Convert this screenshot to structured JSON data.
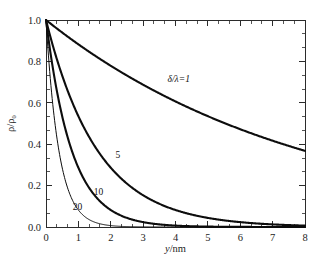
{
  "chart_data": {
    "type": "line",
    "title": "",
    "xlabel": "y/nm",
    "ylabel": "ρ/ρ₀",
    "xlim": [
      0,
      8
    ],
    "ylim": [
      0.0,
      1.0
    ],
    "grid": false,
    "legend_position": "inline-annotations",
    "x_ticks": [
      "0",
      "1",
      "2",
      "3",
      "4",
      "5",
      "6",
      "7",
      "8"
    ],
    "x_tick_values": [
      0,
      1,
      2,
      3,
      4,
      5,
      6,
      7,
      8
    ],
    "x_minor_per_interval": 2,
    "y_ticks": [
      "0.0",
      "0.2",
      "0.4",
      "0.6",
      "0.8",
      "1.0"
    ],
    "y_tick_values": [
      0.0,
      0.2,
      0.4,
      0.6,
      0.8,
      1.0
    ],
    "y_minor_per_interval": 2,
    "x": [
      0,
      0.2,
      0.4,
      0.6,
      0.8,
      1.0,
      1.2,
      1.4,
      1.6,
      1.8,
      2.0,
      2.4,
      2.8,
      3.2,
      3.6,
      4.0,
      4.5,
      5.0,
      5.5,
      6.0,
      6.5,
      7.0,
      7.5,
      8.0
    ],
    "series": [
      {
        "name": "δ/λ=1",
        "label": "δ/λ=1",
        "label_x": 4.1,
        "label_y": 0.7,
        "decay_length_nm": 8.0,
        "line_width": "thick",
        "color": "#0d0d0d",
        "values": [
          1.0,
          0.975,
          0.951,
          0.928,
          0.905,
          0.882,
          0.861,
          0.839,
          0.819,
          0.799,
          0.779,
          0.741,
          0.705,
          0.67,
          0.638,
          0.607,
          0.57,
          0.535,
          0.503,
          0.472,
          0.443,
          0.416,
          0.391,
          0.368
        ]
      },
      {
        "name": "δ/λ=5",
        "label": "5",
        "label_x": 2.22,
        "label_y": 0.335,
        "decay_length_nm": 1.6,
        "line_width": "thick",
        "color": "#0d0d0d",
        "values": [
          1.0,
          0.882,
          0.779,
          0.687,
          0.607,
          0.535,
          0.472,
          0.417,
          0.368,
          0.325,
          0.287,
          0.223,
          0.174,
          0.135,
          0.105,
          0.082,
          0.06,
          0.044,
          0.032,
          0.023,
          0.017,
          0.013,
          0.009,
          0.007
        ]
      },
      {
        "name": "δ/λ=10",
        "label": "10",
        "label_x": 1.62,
        "label_y": 0.155,
        "decay_length_nm": 0.8,
        "line_width": "thick",
        "color": "#0d0d0d",
        "values": [
          1.0,
          0.779,
          0.607,
          0.472,
          0.368,
          0.287,
          0.223,
          0.174,
          0.135,
          0.105,
          0.082,
          0.05,
          0.03,
          0.018,
          0.011,
          0.007,
          0.004,
          0.002,
          0.001,
          0.001,
          0.0,
          0.0,
          0.0,
          0.0
        ]
      },
      {
        "name": "δ/λ=20",
        "label": "20",
        "label_x": 0.97,
        "label_y": 0.082,
        "decay_length_nm": 0.4,
        "line_width": "thin",
        "color": "#3a3a3a",
        "values": [
          1.0,
          0.607,
          0.368,
          0.223,
          0.135,
          0.082,
          0.05,
          0.03,
          0.018,
          0.011,
          0.007,
          0.002,
          0.001,
          0.0,
          0.0,
          0.0,
          0.0,
          0.0,
          0.0,
          0.0,
          0.0,
          0.0,
          0.0,
          0.0
        ]
      }
    ]
  },
  "axes": {
    "x_label_text": "y/nm",
    "x_label_italic_part": "y",
    "x_label_rest": "/nm",
    "y_label_text": "ρ/ρ₀"
  },
  "colors": {
    "background": "#ffffff",
    "frame": "#2b2b2b",
    "curve": "#0d0d0d",
    "curve_light": "#3a3a3a",
    "text": "#1c1c1c"
  }
}
